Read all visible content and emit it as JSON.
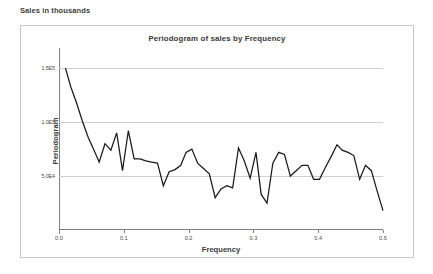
{
  "caption": "Sales in thousands",
  "chart_data": {
    "type": "line",
    "title": "Periodogram of sales by Frequency",
    "xlabel": "Frequency",
    "ylabel": "Periodogram",
    "xlim": [
      0.0,
      0.5
    ],
    "ylim": [
      0,
      165000
    ],
    "grid": true,
    "legend": null,
    "xticks": [
      "0.0",
      "0.1",
      "0.2",
      "0.3",
      "0.4",
      "0.5"
    ],
    "xtick_values": [
      0.0,
      0.1,
      0.2,
      0.3,
      0.4,
      0.5
    ],
    "yticks": [
      "1.5E5",
      "1.0E5",
      "5.0E4"
    ],
    "ytick_values": [
      150000,
      100000,
      50000
    ],
    "series": [
      {
        "name": "Periodogram",
        "color": "#1a1a1a",
        "x": [
          0.01,
          0.018,
          0.027,
          0.036,
          0.045,
          0.054,
          0.062,
          0.071,
          0.08,
          0.089,
          0.098,
          0.107,
          0.116,
          0.125,
          0.134,
          0.143,
          0.152,
          0.161,
          0.17,
          0.179,
          0.188,
          0.196,
          0.205,
          0.214,
          0.223,
          0.232,
          0.241,
          0.25,
          0.259,
          0.268,
          0.277,
          0.286,
          0.295,
          0.304,
          0.312,
          0.321,
          0.33,
          0.339,
          0.348,
          0.357,
          0.366,
          0.375,
          0.384,
          0.393,
          0.402,
          0.411,
          0.42,
          0.429,
          0.437,
          0.446,
          0.455,
          0.464,
          0.473,
          0.482,
          0.491,
          0.5
        ],
        "y": [
          150000,
          133000,
          118000,
          101000,
          86000,
          74000,
          63000,
          80000,
          74000,
          90000,
          55000,
          92000,
          66000,
          66000,
          64000,
          63000,
          62000,
          41000,
          54000,
          56000,
          60000,
          72000,
          75000,
          62000,
          57000,
          52000,
          30000,
          38000,
          41000,
          39000,
          76000,
          64000,
          48000,
          72000,
          33000,
          25000,
          62000,
          72000,
          70000,
          50000,
          55000,
          60000,
          60000,
          47000,
          47000,
          58000,
          68000,
          79000,
          74000,
          72000,
          69000,
          47000,
          60000,
          55000,
          36000,
          18000
        ]
      }
    ]
  }
}
